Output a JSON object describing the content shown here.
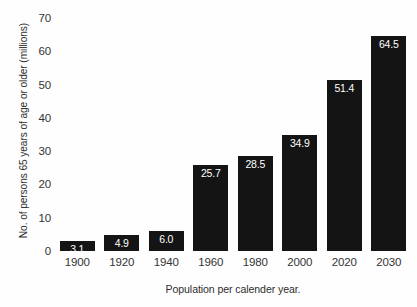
{
  "chart_data": {
    "type": "bar",
    "title": "",
    "subtitle": "",
    "xlabel": "Population per calender year.",
    "ylabel": "No. of persons 65 years of age or older (millions)",
    "categories": [
      "1900",
      "1920",
      "1940",
      "1960",
      "1980",
      "2000",
      "2020",
      "2030"
    ],
    "values": [
      3.1,
      4.9,
      6.0,
      25.7,
      28.5,
      34.9,
      51.4,
      64.5
    ],
    "value_labels": [
      "3.1",
      "4.9",
      "6.0",
      "25.7",
      "28.5",
      "34.9",
      "51.4",
      "64.5"
    ],
    "ylim": [
      0,
      70
    ],
    "yticks": [
      0,
      10,
      20,
      30,
      40,
      50,
      60,
      70
    ],
    "ytick_labels": [
      "0",
      "10",
      "20",
      "30",
      "40",
      "50",
      "60",
      "70"
    ],
    "grid": false,
    "legend": null,
    "bar_color": "#141414",
    "value_label_color": "#ffffff",
    "background_color": "#fefefe",
    "axis_text_color": "#333333"
  }
}
